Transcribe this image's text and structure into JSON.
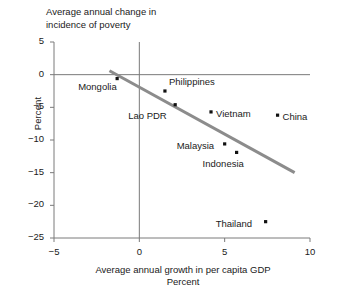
{
  "chart_data": {
    "type": "scatter",
    "title": "Average annual change in\nincidence of poverty",
    "xlabel": "Average annual growth in per capita GDP\nPercent",
    "ylabel": "Percent",
    "xlim": [
      -5,
      10
    ],
    "ylim": [
      -25,
      5
    ],
    "xticks": [
      "-5",
      "0",
      "5",
      "10"
    ],
    "xtick_values": [
      -5,
      0,
      5,
      10
    ],
    "yticks": [
      "5",
      "0",
      "-5",
      "-10",
      "-15",
      "-20",
      "-25"
    ],
    "ytick_values": [
      5,
      0,
      -5,
      -10,
      -15,
      -20,
      -25
    ],
    "grid": false,
    "legend": null,
    "reference_lines": [
      {
        "name": "zero-horizontal",
        "axis": "y",
        "value": 0
      },
      {
        "name": "zero-vertical",
        "axis": "x",
        "value": 0
      }
    ],
    "trendline": {
      "name": "fitted-trend",
      "x": [
        -1.75,
        9.1
      ],
      "y": [
        0.6,
        -15.0
      ],
      "color": "#8c8c8c"
    },
    "points": [
      {
        "name": "Mongolia",
        "x": -1.3,
        "y": -0.6,
        "label_dx": -39,
        "label_dy": 9
      },
      {
        "name": "Philippines",
        "x": 1.5,
        "y": -2.5,
        "label_dx": 4,
        "label_dy": -8
      },
      {
        "name": "Lao PDR",
        "x": 2.1,
        "y": -4.6,
        "label_dx": -47,
        "label_dy": 12
      },
      {
        "name": "Vietnam",
        "x": 4.2,
        "y": -5.7,
        "label_dx": 5,
        "label_dy": 3
      },
      {
        "name": "China",
        "x": 8.1,
        "y": -6.2,
        "label_dx": 5,
        "label_dy": 3
      },
      {
        "name": "Malaysia",
        "x": 5.0,
        "y": -10.6,
        "label_dx": -48,
        "label_dy": 3
      },
      {
        "name": "Indonesia",
        "x": 5.7,
        "y": -11.9,
        "label_dx": -34,
        "label_dy": 13
      },
      {
        "name": "Thailand",
        "x": 7.4,
        "y": -22.5,
        "label_dx": -50,
        "label_dy": 3
      }
    ],
    "colors": {
      "point": "#111111",
      "axis": "#7a7a7a",
      "trend": "#8c8c8c",
      "text": "#1a1a1a",
      "background": "#ffffff"
    }
  }
}
